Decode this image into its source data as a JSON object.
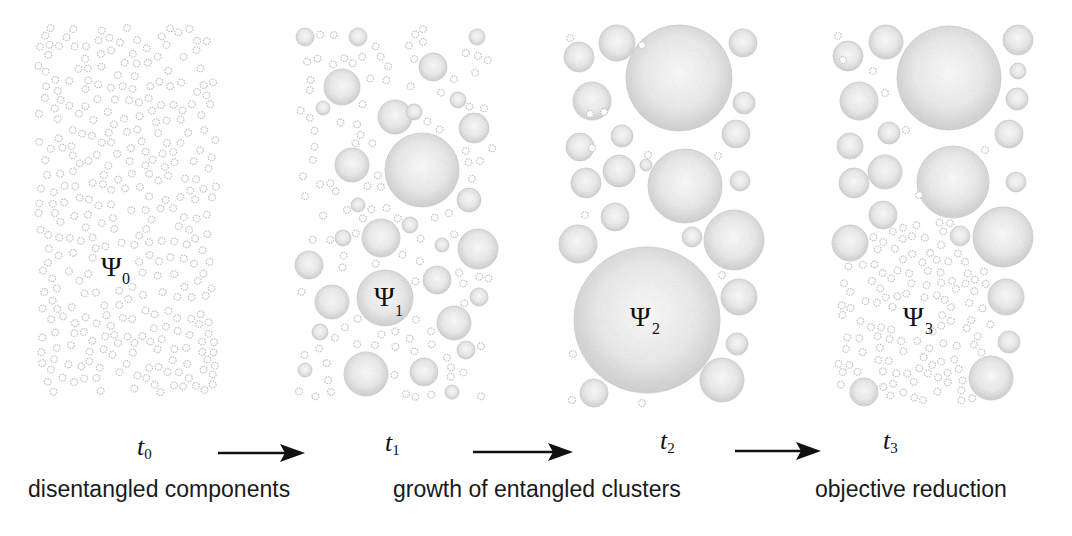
{
  "diagram": {
    "stages": [
      {
        "id": "stage-0",
        "state_symbol": "Ψ",
        "state_index": "0",
        "time_symbol": "t",
        "time_index": "0",
        "caption": "disentangled components",
        "bubble_description": "many small uniform components"
      },
      {
        "id": "stage-1",
        "state_symbol": "Ψ",
        "state_index": "1",
        "time_symbol": "t",
        "time_index": "1",
        "caption": "",
        "bubble_description": "mixture of small and medium clusters"
      },
      {
        "id": "stage-2",
        "state_symbol": "Ψ",
        "state_index": "2",
        "time_symbol": "t",
        "time_index": "2",
        "caption": "growth of entangled clusters",
        "bubble_description": "few large entangled clusters"
      },
      {
        "id": "stage-3",
        "state_symbol": "Ψ",
        "state_index": "3",
        "time_symbol": "t",
        "time_index": "3",
        "caption": "objective reduction",
        "bubble_description": "largest cluster reduced into small components"
      }
    ],
    "arrows": [
      {
        "from": "t0",
        "to": "t1"
      },
      {
        "from": "t1",
        "to": "t2"
      },
      {
        "from": "t2",
        "to": "t3"
      }
    ],
    "colors": {
      "bubble_edge": "#b8b8b8",
      "bubble_fill_center": "#fbfbfb",
      "bubble_fill_edge": "#d4d4d4",
      "text": "#111111",
      "arrow": "#111111"
    }
  }
}
